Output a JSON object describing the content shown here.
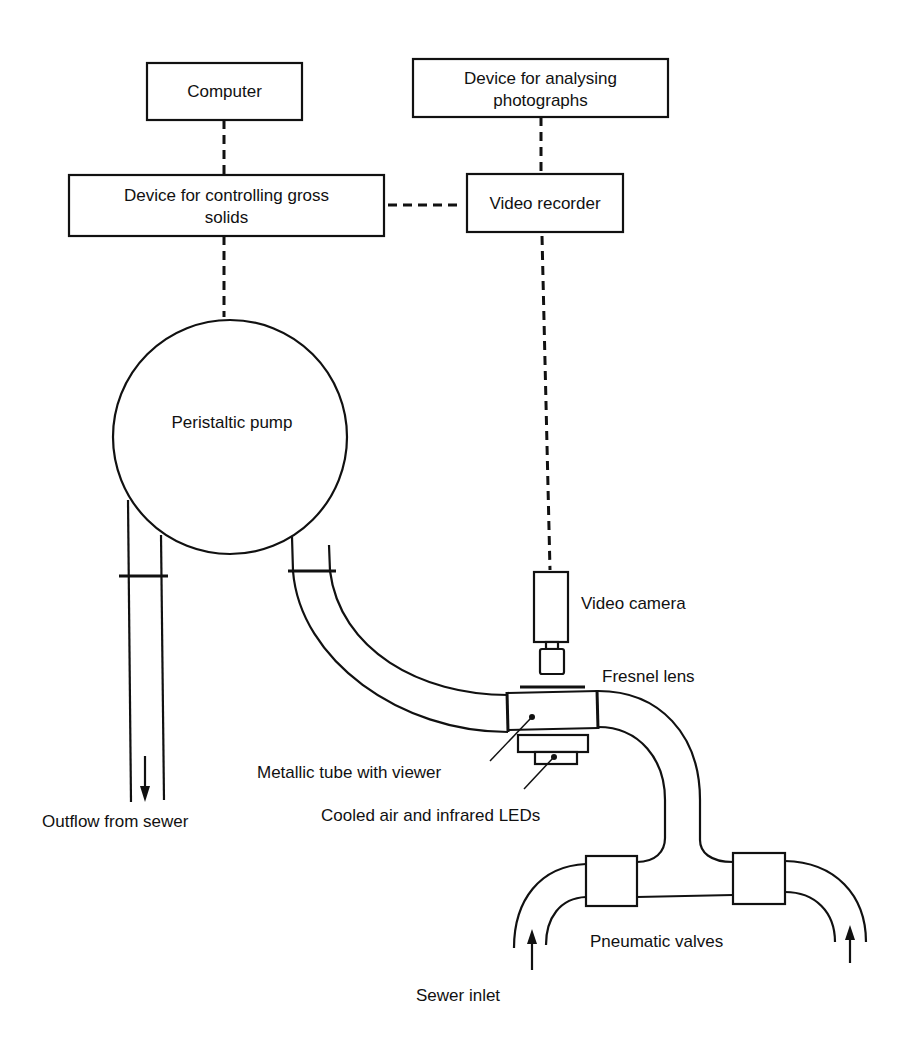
{
  "diagram": {
    "boxes": {
      "computer": "Computer",
      "analysing_line1": "Device for analysing",
      "analysing_line2": "photographs",
      "gross_solids_line1": "Device for controlling gross",
      "gross_solids_line2": "solids",
      "video_recorder": "Video recorder"
    },
    "components": {
      "peristaltic_pump": "Peristaltic pump",
      "video_camera": "Video camera",
      "fresnel_lens": "Fresnel lens",
      "metallic_tube": "Metallic tube with viewer",
      "cooled_air": "Cooled air and infrared LEDs",
      "pneumatic_valves": "Pneumatic valves"
    },
    "flows": {
      "outflow": "Outflow from sewer",
      "inlet": "Sewer inlet"
    },
    "colors": {
      "ink": "#111111",
      "background": "#ffffff"
    }
  }
}
